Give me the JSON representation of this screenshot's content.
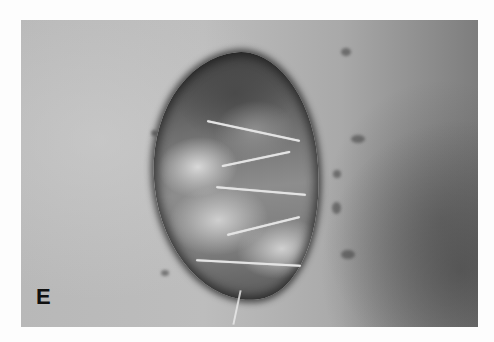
{
  "figure": {
    "panel_label": "E",
    "colors": {
      "background": "#fdfdfd",
      "skin": "#bdbdbd",
      "wound_dark": "#3f3f3f",
      "suture": "#e4e4e4",
      "label": "#111111"
    }
  }
}
